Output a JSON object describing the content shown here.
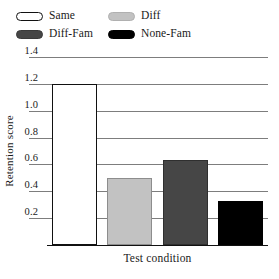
{
  "chart_data": {
    "type": "bar",
    "title": "",
    "xlabel": "Test condition",
    "ylabel": "Retention score",
    "categories": [
      "Same",
      "Diff",
      "Diff-Fam",
      "None-Fam"
    ],
    "values": [
      1.2,
      0.5,
      0.63,
      0.33
    ],
    "ylim": [
      0.0,
      1.4
    ],
    "yticks": [
      "1.4",
      "1.2",
      "1.0",
      "0.8",
      "0.6",
      "0.4",
      "0.2"
    ],
    "ytick_values": [
      1.4,
      1.2,
      1.0,
      0.8,
      0.6,
      0.4,
      0.2
    ],
    "grid": true,
    "legend_position": "top-left",
    "series": [
      {
        "name": "Retention score",
        "values": [
          1.2,
          0.5,
          0.63,
          0.33
        ]
      }
    ],
    "bar_colors": [
      "#ffffff",
      "#c2c2c2",
      "#464646",
      "#000000"
    ],
    "bar_edge_colors": [
      "#111111",
      "#8d8d8d",
      "#2f2f2f",
      "#000000"
    ]
  },
  "legend": {
    "items": [
      {
        "label": "Same",
        "color": "#ffffff",
        "border": "#111111"
      },
      {
        "label": "Diff",
        "color": "#c2c2c2",
        "border": "#b0b0b0"
      },
      {
        "label": "Diff-Fam",
        "color": "#464646",
        "border": "#3a3a3a"
      },
      {
        "label": "None-Fam",
        "color": "#000000",
        "border": "#000000"
      }
    ]
  },
  "axes": {
    "y_title": "Retention score",
    "x_title": "Test condition",
    "y_labels": {
      "t14": "1.4",
      "t12": "1.2",
      "t10": "1.0",
      "t08": "0.8",
      "t06": "0.6",
      "t04": "0.4",
      "t02": "0.2"
    }
  }
}
